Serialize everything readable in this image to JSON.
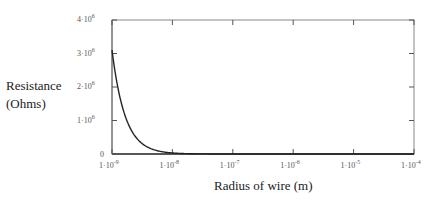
{
  "chart_data": {
    "type": "line",
    "title": "",
    "xlabel": "Radius of wire (m)",
    "ylabel": "Resistance (Ohms)",
    "ylabel_lines": [
      "Resistance",
      "(Ohms)"
    ],
    "xscale": "log",
    "xlim": [
      1e-09,
      0.0001
    ],
    "ylim": [
      0,
      4000000
    ],
    "x_ticks": [
      {
        "mant": "1·10",
        "exp": "-9"
      },
      {
        "mant": "1·10",
        "exp": "-8"
      },
      {
        "mant": "1·10",
        "exp": "-7"
      },
      {
        "mant": "1·10",
        "exp": "-6"
      },
      {
        "mant": "1·10",
        "exp": "-5"
      },
      {
        "mant": "1·10",
        "exp": "-4"
      }
    ],
    "y_ticks": [
      {
        "label": "0",
        "mant": "",
        "exp": ""
      },
      {
        "mant": "1·10",
        "exp": "6"
      },
      {
        "mant": "2·10",
        "exp": "6"
      },
      {
        "mant": "3·10",
        "exp": "6"
      },
      {
        "mant": "4·10",
        "exp": "6"
      }
    ],
    "grid": false,
    "legend": null,
    "series": [
      {
        "name": "Resistance",
        "x": [
          1e-09,
          1.2e-09,
          1.5e-09,
          2e-09,
          3e-09,
          4e-09,
          5e-09,
          7e-09,
          1e-08,
          2e-08,
          1e-07,
          1e-06,
          1e-05,
          0.0001
        ],
        "y": [
          3100000,
          2150000,
          1380000,
          775000,
          345000,
          194000,
          124000,
          63000,
          31000,
          7750,
          310,
          3.1,
          0.031,
          0.00031
        ]
      }
    ]
  }
}
